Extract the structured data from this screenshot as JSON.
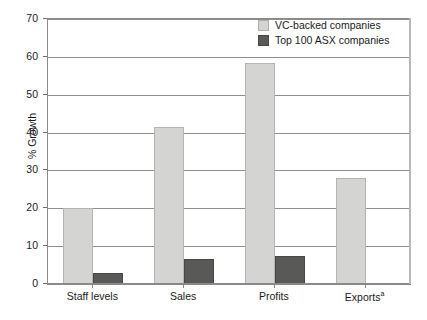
{
  "chart_data": {
    "type": "bar",
    "title": "",
    "subtitle": "",
    "xlabel": "",
    "ylabel": "% Growth",
    "categories": [
      "Staff levels",
      "Sales",
      "Profits",
      "Exportsᵃ"
    ],
    "category_labels_plain": [
      "Staff levels",
      "Sales",
      "Profits",
      "Exports"
    ],
    "category_footnote_marks": [
      "",
      "",
      "",
      "a"
    ],
    "series": [
      {
        "name": "VC-backed companies",
        "color": "#d4d4d2",
        "values": [
          20.0,
          41.5,
          58.5,
          28.0
        ]
      },
      {
        "name": "Top 100 ASX companies",
        "color": "#595957",
        "values": [
          2.9,
          6.5,
          7.3,
          null
        ]
      }
    ],
    "ylim": [
      0,
      70
    ],
    "yticks": [
      0,
      10,
      20,
      30,
      40,
      50,
      60,
      70
    ],
    "ytick_labels": [
      "0",
      "10",
      "20",
      "30",
      "40",
      "50",
      "60",
      "70"
    ],
    "grid": "horizontal",
    "legend_position": "top-right",
    "bar_layout": "grouped-adjacent"
  },
  "legend": {
    "entries": [
      {
        "label": "VC-backed companies",
        "swatch": "light"
      },
      {
        "label": "Top 100 ASX companies",
        "swatch": "dark"
      }
    ]
  },
  "colors": {
    "series_light": "#d4d4d2",
    "series_dark": "#595957",
    "gridline": "#8f8f8f",
    "axis": "#8a8a8a",
    "text": "#1a1a1a",
    "background": "#ffffff"
  }
}
